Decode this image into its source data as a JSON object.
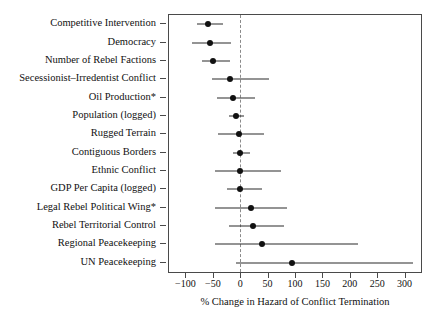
{
  "chart_data": {
    "type": "scatter",
    "title": "",
    "xlabel": "% Change in Hazard of Conflict Termination",
    "ylabel": "",
    "xlim": [
      -130,
      330
    ],
    "ticks": [
      -100,
      -50,
      0,
      50,
      100,
      150,
      200,
      250,
      300
    ],
    "tick_labels": [
      "−100",
      "−50",
      "0",
      "50",
      "100",
      "150",
      "200",
      "250",
      "300"
    ],
    "grid": false,
    "legend": "none",
    "reference_line": 0,
    "reference_line_style": "dashed",
    "categories": [
      "Competitive Intervention",
      "Democracy",
      "Number of Rebel Factions",
      "Secessionist–Irredentist Conflict",
      "Oil Production*",
      "Population (logged)",
      "Rugged Terrain",
      "Contiguous Borders",
      "Ethnic Conflict",
      "GDP Per Capita (logged)",
      "Legal Rebel Political Wing*",
      "Rebel Territorial Control",
      "Regional Peacekeeping",
      "UN Peacekeeping"
    ],
    "values": [
      -59,
      -56,
      -49,
      -19,
      -13,
      -8,
      -3,
      0,
      0,
      0,
      19,
      24,
      39,
      95
    ],
    "ci_low": [
      -79,
      -88,
      -69,
      -52,
      -42,
      -20,
      -41,
      -14,
      -46,
      -24,
      -46,
      -20,
      -46,
      -8
    ],
    "ci_high": [
      -32,
      -16,
      -19,
      53,
      27,
      7,
      44,
      17,
      75,
      39,
      85,
      80,
      215,
      315
    ],
    "point_color": "#111111",
    "line_color": "#2b2b2b",
    "reference_line_color": "#8a8a8a"
  }
}
